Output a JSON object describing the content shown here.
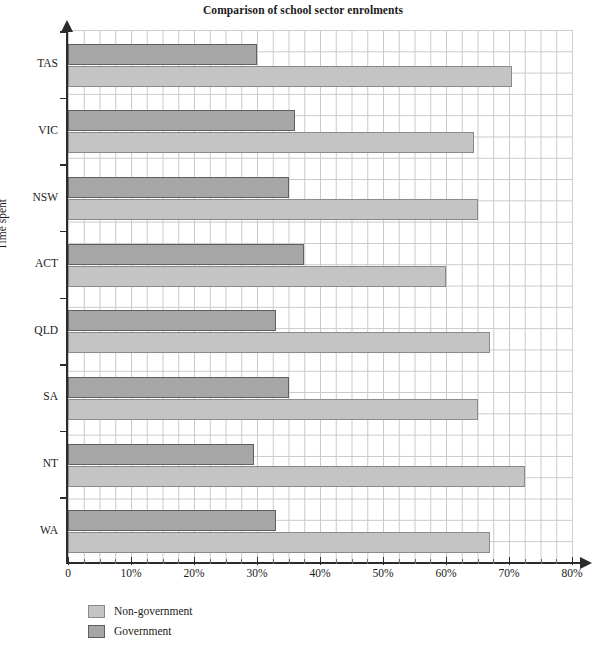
{
  "chart_data": {
    "type": "bar",
    "orientation": "horizontal",
    "title": "Comparison of school sector enrolments",
    "xlabel": "",
    "ylabel": "Time spent",
    "categories": [
      "TAS",
      "VIC",
      "NSW",
      "ACT",
      "QLD",
      "SA",
      "NT",
      "WA"
    ],
    "series": [
      {
        "name": "Non-government",
        "color": "#c4c4c4",
        "values": [
          70.5,
          64.5,
          65.0,
          60.0,
          67.0,
          65.0,
          72.5,
          67.0
        ]
      },
      {
        "name": "Government",
        "color": "#a6a6a6",
        "values": [
          30.0,
          36.0,
          35.0,
          37.5,
          33.0,
          35.0,
          29.5,
          33.0
        ]
      }
    ],
    "xlim": [
      0,
      80
    ],
    "xtick_labels": [
      "0",
      "10%",
      "20%",
      "30%",
      "40%",
      "50%",
      "60%",
      "70%",
      "80%"
    ],
    "xtick_values": [
      0,
      10,
      20,
      30,
      40,
      50,
      60,
      70,
      80
    ],
    "grid": true,
    "legend_position": "bottom-left"
  },
  "legend": {
    "items": [
      {
        "label": "Non-government",
        "swatch": "nongov"
      },
      {
        "label": "Government",
        "swatch": "gov"
      }
    ]
  }
}
